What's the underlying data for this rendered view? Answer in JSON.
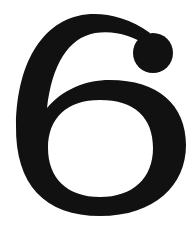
{
  "image": {
    "glyph": "6",
    "colors": {
      "foreground": "#111111",
      "background": "#ffffff"
    }
  }
}
